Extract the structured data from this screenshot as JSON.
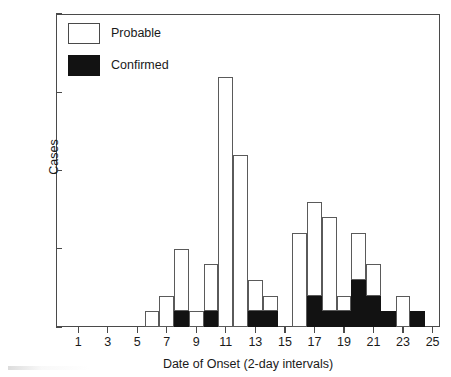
{
  "chart_data": {
    "type": "bar",
    "title": "",
    "subtitle": "",
    "xlabel": "Date of Onset (2-day intervals)",
    "ylabel": "Cases",
    "stacked": true,
    "grid": false,
    "legend_position": "top-left",
    "xlim": [
      0,
      26
    ],
    "ylim": [
      0,
      20
    ],
    "y_ticks": [
      0,
      5,
      10,
      15,
      20
    ],
    "x_ticks": [
      1,
      3,
      5,
      7,
      9,
      11,
      13,
      15,
      17,
      19,
      21,
      23,
      25
    ],
    "x_tick_labels": [
      "1",
      "3",
      "5",
      "7",
      "9",
      "11",
      "13",
      "15",
      "17",
      "19",
      "21",
      "23",
      "25"
    ],
    "y_tick_labels": [
      "0",
      "5",
      "10",
      "15",
      "20"
    ],
    "categories": [
      1,
      2,
      3,
      4,
      5,
      6,
      7,
      8,
      9,
      10,
      11,
      12,
      13,
      14,
      15,
      16,
      17,
      18,
      19,
      20,
      21,
      22,
      23,
      24,
      25
    ],
    "series": [
      {
        "name": "Confirmed",
        "color": "#121212",
        "values": [
          0,
          0,
          0,
          0,
          0,
          0,
          0,
          1,
          0,
          1,
          0,
          0,
          1,
          1,
          0,
          0,
          2,
          1,
          1,
          3,
          2,
          1,
          0,
          1,
          0
        ]
      },
      {
        "name": "Probable",
        "color": "#ffffff",
        "values": [
          0,
          0,
          0,
          0,
          0,
          1,
          2,
          4,
          1,
          3,
          16,
          11,
          2,
          1,
          0,
          6,
          6,
          6,
          1,
          3,
          2,
          0,
          2,
          0,
          0
        ]
      }
    ],
    "totals": [
      0,
      0,
      0,
      0,
      0,
      1,
      2,
      5,
      1,
      4,
      16,
      11,
      3,
      2,
      0,
      6,
      8,
      7,
      2,
      6,
      4,
      1,
      2,
      1,
      0
    ]
  },
  "legend": {
    "items": [
      {
        "label": "Probable",
        "swatch": "white-outlined-square"
      },
      {
        "label": "Confirmed",
        "swatch": "black-filled-square"
      }
    ]
  },
  "axes": {
    "y_title": "Cases",
    "x_title": "Date of Onset (2-day intervals)"
  }
}
